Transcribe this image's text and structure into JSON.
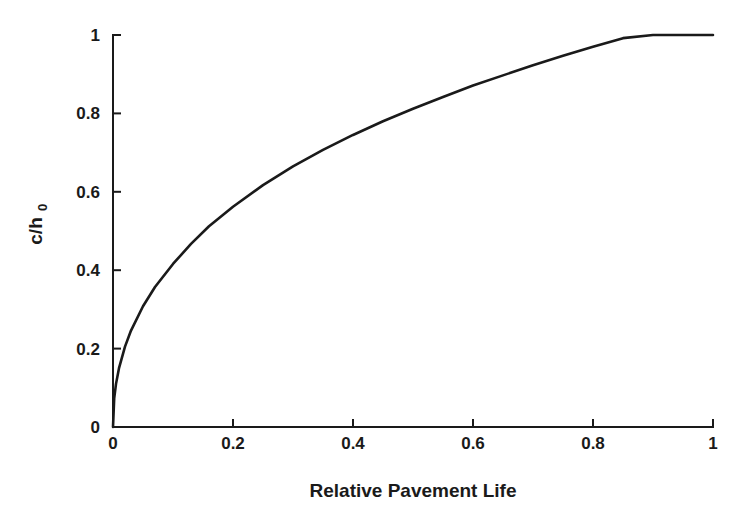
{
  "chart_data": {
    "type": "line",
    "title": "",
    "xlabel": "Relative Pavement Life",
    "ylabel": "c/h",
    "ylabel_subscript": "0",
    "xlim": [
      0,
      1
    ],
    "ylim": [
      0,
      1
    ],
    "grid": false,
    "legend": "none",
    "x_ticks": [
      {
        "value": 0,
        "label": "0"
      },
      {
        "value": 0.2,
        "label": "0.2"
      },
      {
        "value": 0.4,
        "label": "0.4"
      },
      {
        "value": 0.6,
        "label": "0.6"
      },
      {
        "value": 0.8,
        "label": "0.8"
      },
      {
        "value": 1,
        "label": "1"
      }
    ],
    "y_ticks": [
      {
        "value": 0,
        "label": "0"
      },
      {
        "value": 0.2,
        "label": "0.2"
      },
      {
        "value": 0.4,
        "label": "0.4"
      },
      {
        "value": 0.6,
        "label": "0.6"
      },
      {
        "value": 0.8,
        "label": "0.8"
      },
      {
        "value": 1,
        "label": "1"
      }
    ],
    "series": [
      {
        "name": "c/h0 vs Relative Pavement Life",
        "color": "#1a1a1a",
        "x": [
          0,
          0.002,
          0.005,
          0.01,
          0.02,
          0.03,
          0.05,
          0.07,
          0.1,
          0.13,
          0.16,
          0.2,
          0.25,
          0.3,
          0.35,
          0.4,
          0.45,
          0.5,
          0.55,
          0.6,
          0.65,
          0.7,
          0.75,
          0.8,
          0.85,
          0.9,
          0.95,
          1.0
        ],
        "y": [
          0,
          0.073,
          0.11,
          0.15,
          0.205,
          0.246,
          0.308,
          0.357,
          0.416,
          0.467,
          0.512,
          0.562,
          0.617,
          0.665,
          0.707,
          0.745,
          0.78,
          0.812,
          0.842,
          0.871,
          0.897,
          0.923,
          0.947,
          0.97,
          0.992,
          1.0,
          1.0,
          1.0
        ]
      }
    ],
    "colors": {
      "axis": "#1a1a1a",
      "curve": "#1a1a1a",
      "background": "#ffffff"
    }
  },
  "plot_geometry": {
    "left": 113,
    "right": 713,
    "top": 35,
    "bottom": 427
  }
}
